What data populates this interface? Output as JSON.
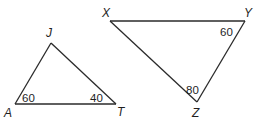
{
  "triangles": [
    {
      "name": "JAT",
      "vertices": {
        "J": {
          "label": "J",
          "x": 51,
          "y": 43
        },
        "A": {
          "label": "A",
          "x": 15,
          "y": 104
        },
        "T": {
          "label": "T",
          "x": 116,
          "y": 104
        }
      },
      "angles": {
        "A": "60",
        "T": "40"
      }
    },
    {
      "name": "XYZ",
      "vertices": {
        "X": {
          "label": "X",
          "x": 110,
          "y": 21
        },
        "Y": {
          "label": "Y",
          "x": 245,
          "y": 21
        },
        "Z": {
          "label": "Z",
          "x": 197,
          "y": 102
        }
      },
      "angles": {
        "Y": "60",
        "Z": "80"
      }
    }
  ]
}
